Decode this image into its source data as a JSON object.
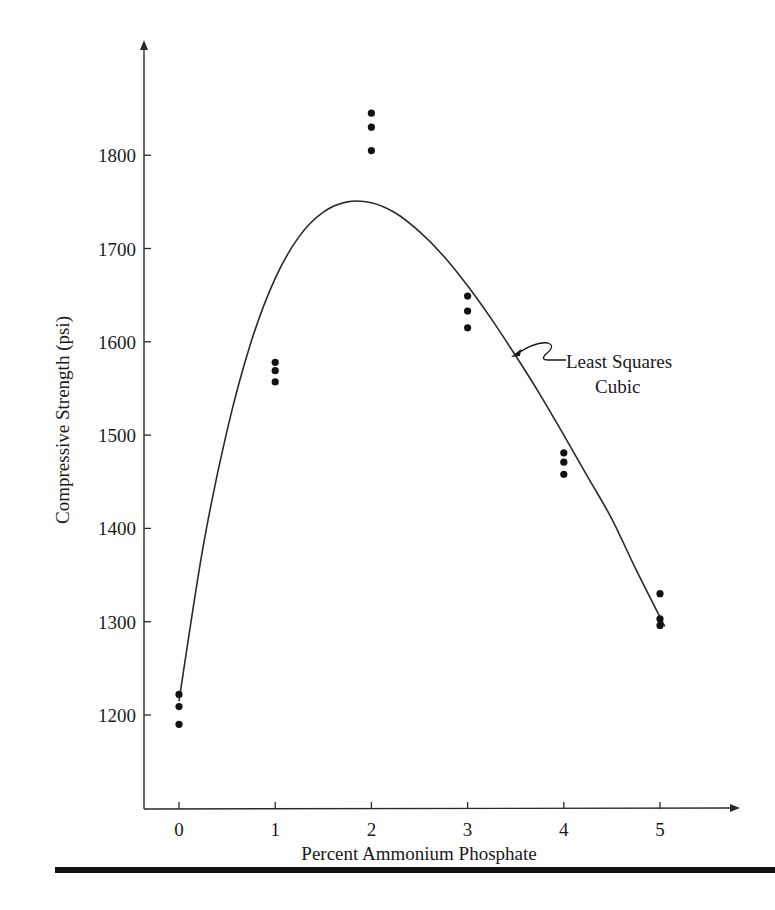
{
  "chart_data": {
    "type": "scatter",
    "title": "",
    "xlabel": "Percent Ammonium Phosphate",
    "ylabel": "Compressive Strength (psi)",
    "x_ticks": [
      0,
      1,
      2,
      3,
      4,
      5
    ],
    "y_ticks": [
      1200,
      1300,
      1400,
      1500,
      1600,
      1700,
      1800
    ],
    "xlim": [
      -0.4,
      5.8
    ],
    "ylim": [
      1110,
      1900
    ],
    "grid": false,
    "legend": null,
    "series": [
      {
        "name": "Observations",
        "type": "scatter",
        "points": [
          {
            "x": 0,
            "y": 1222
          },
          {
            "x": 0,
            "y": 1209
          },
          {
            "x": 0,
            "y": 1190
          },
          {
            "x": 1,
            "y": 1578
          },
          {
            "x": 1,
            "y": 1569
          },
          {
            "x": 1,
            "y": 1557
          },
          {
            "x": 2,
            "y": 1845
          },
          {
            "x": 2,
            "y": 1830
          },
          {
            "x": 2,
            "y": 1805
          },
          {
            "x": 3,
            "y": 1649
          },
          {
            "x": 3,
            "y": 1633
          },
          {
            "x": 3,
            "y": 1615
          },
          {
            "x": 4,
            "y": 1481
          },
          {
            "x": 4,
            "y": 1471
          },
          {
            "x": 4,
            "y": 1458
          },
          {
            "x": 5,
            "y": 1330
          },
          {
            "x": 5,
            "y": 1303
          },
          {
            "x": 5,
            "y": 1296
          }
        ]
      },
      {
        "name": "Least Squares Cubic",
        "type": "line",
        "points": [
          {
            "x": 0,
            "y": 1215
          },
          {
            "x": 0.25,
            "y": 1380
          },
          {
            "x": 0.5,
            "y": 1505
          },
          {
            "x": 0.75,
            "y": 1600
          },
          {
            "x": 1,
            "y": 1668
          },
          {
            "x": 1.25,
            "y": 1713
          },
          {
            "x": 1.5,
            "y": 1739
          },
          {
            "x": 1.75,
            "y": 1750
          },
          {
            "x": 2,
            "y": 1749
          },
          {
            "x": 2.25,
            "y": 1738
          },
          {
            "x": 2.5,
            "y": 1718
          },
          {
            "x": 2.75,
            "y": 1692
          },
          {
            "x": 3,
            "y": 1660
          },
          {
            "x": 3.25,
            "y": 1624
          },
          {
            "x": 3.5,
            "y": 1585
          },
          {
            "x": 3.75,
            "y": 1544
          },
          {
            "x": 4,
            "y": 1500
          },
          {
            "x": 4.25,
            "y": 1455
          },
          {
            "x": 4.5,
            "y": 1410
          },
          {
            "x": 4.75,
            "y": 1356
          },
          {
            "x": 5,
            "y": 1305
          },
          {
            "x": 5.05,
            "y": 1295
          }
        ]
      }
    ],
    "annotations": [
      {
        "text_lines": [
          "Least Squares",
          "Cubic"
        ],
        "points_to": {
          "x": 3.45,
          "y": 1593
        }
      }
    ]
  }
}
